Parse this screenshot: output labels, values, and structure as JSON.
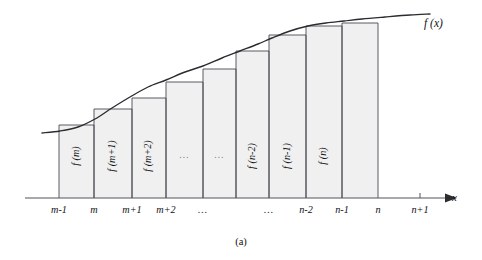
{
  "figure": {
    "caption": "(a)",
    "curve_label": "f (x)",
    "x_axis_label": "x",
    "colors": {
      "bar_fill": "#f0f0f0",
      "bar_stroke": "#4b4b52",
      "curve": "#2b2b30",
      "axis": "#55555c",
      "text": "#101014",
      "background": "#ffffff"
    }
  },
  "chart_data": {
    "type": "bar",
    "title": "",
    "subtitle": "",
    "xlabel": "x",
    "ylabel": "",
    "grid": false,
    "legend": null,
    "categories": [
      "m-1",
      "m",
      "m+1",
      "m+2",
      "…",
      "…",
      "n-2",
      "n-1",
      "n"
    ],
    "values": [
      125,
      109,
      98,
      82,
      69,
      51,
      35,
      26,
      23
    ],
    "value_meaning": "pixel y of each rectangle top (smaller y = taller bar)",
    "bar_labels": [
      "f (m)",
      "f (m+1)",
      "f (m+2)",
      "…",
      "…",
      "f (n-2)",
      "f (n-1)",
      "f (n)"
    ],
    "x_tick_labels": [
      "m-1",
      "m",
      "m+1",
      "m+2",
      "…",
      "…",
      "n-2",
      "n-1",
      "n",
      "n+1"
    ],
    "x_tick_positions": [
      59,
      94,
      132,
      166,
      203,
      269,
      306,
      342,
      378,
      420
    ],
    "bar_edges": [
      59,
      94,
      132,
      166,
      203,
      236,
      269,
      306,
      342,
      378
    ],
    "bar_tops": [
      125,
      109,
      98,
      82,
      69,
      51,
      35,
      26,
      23
    ],
    "baseline_y": 198,
    "axis_range_x": [
      25,
      445
    ],
    "curve_label": "f (x)",
    "curve_points": [
      [
        42,
        133
      ],
      [
        60,
        131
      ],
      [
        78,
        127
      ],
      [
        95,
        119
      ],
      [
        112,
        108
      ],
      [
        130,
        97
      ],
      [
        148,
        87
      ],
      [
        166,
        80
      ],
      [
        185,
        72
      ],
      [
        203,
        66
      ],
      [
        222,
        58
      ],
      [
        240,
        51
      ],
      [
        258,
        44
      ],
      [
        272,
        38
      ],
      [
        290,
        31
      ],
      [
        308,
        26
      ],
      [
        326,
        23
      ],
      [
        344,
        21
      ],
      [
        362,
        19
      ],
      [
        385,
        17
      ],
      [
        410,
        15
      ],
      [
        430,
        14
      ]
    ]
  }
}
